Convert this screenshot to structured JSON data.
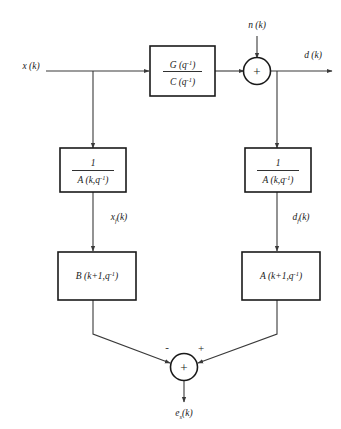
{
  "diagram": {
    "colors": {
      "background": "#ffffff",
      "wire": "#3a3a3a",
      "block_border": "#1a1a1a",
      "text": "#1a1a1a"
    },
    "signals": {
      "input_x": "x (k)",
      "noise_n": "n (k)",
      "output_d": "d (k)",
      "filtered_x": "x",
      "filtered_x_sub": "f",
      "filtered_x_tail": "(k)",
      "filtered_d": "d",
      "filtered_d_sub": "f",
      "filtered_d_tail": "(k)",
      "error_e": "e",
      "error_sub": "s",
      "error_tail": "(k)"
    },
    "blocks": [
      {
        "id": "plant",
        "name": "plant-transfer-function-block",
        "kind": "fraction",
        "numerator_main": "G (q",
        "numerator_sup": "-1",
        "numerator_tail": ")",
        "denominator_main": "C (q",
        "denominator_sup": "-1",
        "denominator_tail": ")"
      },
      {
        "id": "inv-a-left",
        "name": "inverse-a-left-block",
        "kind": "fraction",
        "numerator_main": "1",
        "numerator_sup": "",
        "numerator_tail": "",
        "denominator_main": "A (k,q",
        "denominator_sup": "-1",
        "denominator_tail": ")"
      },
      {
        "id": "inv-a-right",
        "name": "inverse-a-right-block",
        "kind": "fraction",
        "numerator_main": "1",
        "numerator_sup": "",
        "numerator_tail": "",
        "denominator_main": "A (k,q",
        "denominator_sup": "-1",
        "denominator_tail": ")"
      },
      {
        "id": "b-update",
        "name": "b-polynomial-block",
        "kind": "single",
        "main": "B (k+1,q",
        "sup": "-1",
        "tail": ")"
      },
      {
        "id": "a-update",
        "name": "a-polynomial-block",
        "kind": "single",
        "main": "A (k+1,q",
        "sup": "-1",
        "tail": ")"
      }
    ],
    "summers": [
      {
        "id": "sum-top",
        "name": "top-summing-junction",
        "glyph": "+",
        "signs": []
      },
      {
        "id": "sum-bottom",
        "name": "bottom-summing-junction",
        "glyph": "+",
        "signs": [
          {
            "label": "-",
            "position": "left"
          },
          {
            "label": "+",
            "position": "right"
          }
        ]
      }
    ]
  }
}
